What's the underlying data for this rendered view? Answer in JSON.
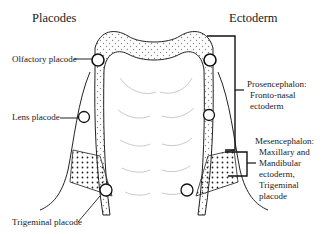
{
  "headers": {
    "left": "Placodes",
    "right": "Ectoderm"
  },
  "labels": {
    "olfactory": "Olfactory placode",
    "lens": "Lens placode",
    "trigeminal": "Trigeminal placode"
  },
  "regions": {
    "prosencephalon": [
      "Prosencephalon:",
      "Fronto-nasal",
      "ectoderm"
    ],
    "mesencephalon": [
      "Mesencephalon:",
      "Maxillary and",
      "Mandibular",
      "ectoderm,",
      "Trigeminal",
      "placode"
    ]
  },
  "colors": {
    "line": "#1a1a1a",
    "fill": "#ffffff",
    "stipple": "#555555",
    "fold": "#bbbbbb"
  }
}
